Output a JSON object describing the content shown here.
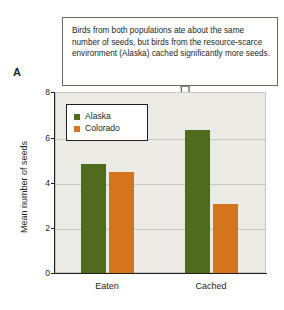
{
  "panel": {
    "label": "A"
  },
  "callout": {
    "text": "Birds from both populations ate about the same number of seeds, but birds from the resource-scarce environment (Alaska) cached significantly more seeds.",
    "border_color": "#6b6a5b",
    "points_to": "alaska-cached-bar"
  },
  "chart_data": {
    "type": "bar",
    "title": "",
    "xlabel": "",
    "ylabel": "Mean number of seeds",
    "categories": [
      "Eaten",
      "Cached"
    ],
    "series": [
      {
        "name": "Alaska",
        "color": "#4f6b1e",
        "values": [
          4.8,
          6.3
        ]
      },
      {
        "name": "Colorado",
        "color": "#d4741c",
        "values": [
          4.45,
          3.05
        ]
      }
    ],
    "ylim": [
      0,
      8
    ],
    "yticks": [
      0,
      2,
      4,
      6,
      8
    ],
    "ytick_labels": [
      "0",
      "2",
      "4",
      "6",
      "8"
    ],
    "grid": true,
    "legend_position": "upper-left",
    "plot_background": "#eceae4"
  },
  "legend": {
    "entries": [
      {
        "label": "Alaska",
        "color": "#4f6b1e"
      },
      {
        "label": "Colorado",
        "color": "#d4741c"
      }
    ]
  }
}
